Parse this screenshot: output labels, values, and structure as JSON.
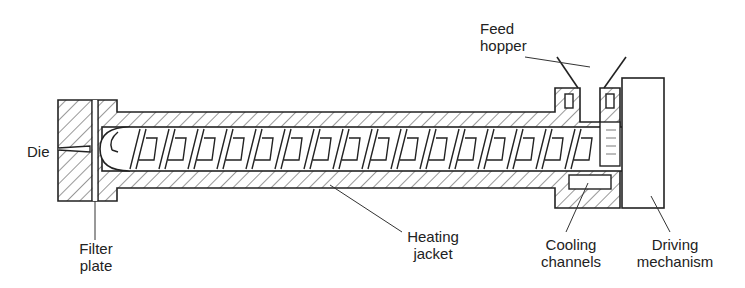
{
  "diagram": {
    "type": "screw-extruder cross-section",
    "labels": {
      "die": "Die",
      "filter_plate_1": "Filter",
      "filter_plate_2": "plate",
      "heating_jacket_1": "Heating",
      "heating_jacket_2": "jacket",
      "feed_hopper_1": "Feed",
      "feed_hopper_2": "hopper",
      "cooling_channels_1": "Cooling",
      "cooling_channels_2": "channels",
      "driving_mechanism_1": "Driving",
      "driving_mechanism_2": "mechanism"
    },
    "colors": {
      "line": "#222222",
      "background": "#ffffff"
    }
  }
}
